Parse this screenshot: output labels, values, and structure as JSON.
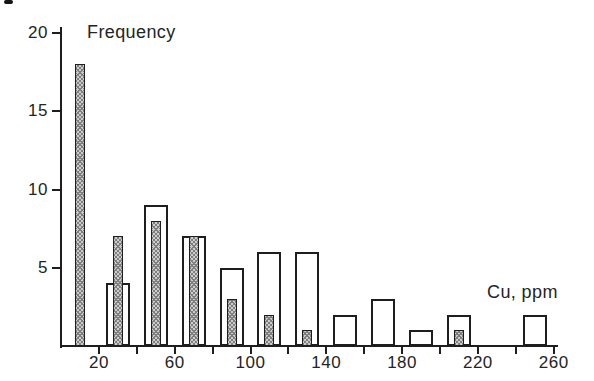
{
  "figure": {
    "kind": "scanned histogram figure",
    "background": "#ffffff"
  },
  "colors": {
    "ink": "#1e1e1e",
    "text": "#242424",
    "hatch_fill": "#cccccc",
    "hatch_line": "#7f7f7f",
    "open_bar_fill": "#ffffff"
  },
  "chart_data": {
    "type": "bar",
    "subtype": "overlaid histograms",
    "title": "",
    "ylabel": "Frequency",
    "xlabel": "Cu, ppm",
    "ylim": [
      0,
      20
    ],
    "y_ticks": [
      5,
      10,
      15,
      20
    ],
    "x_range_ppm": [
      0,
      262
    ],
    "x_minor_ticks": [
      20,
      40,
      60,
      80,
      100,
      120,
      140,
      160,
      180,
      200,
      220,
      240,
      260
    ],
    "x_labeled_ticks": [
      20,
      60,
      100,
      140,
      180,
      220,
      260
    ],
    "class_width_ppm": 20,
    "categories": [
      10,
      30,
      50,
      70,
      90,
      110,
      130,
      150,
      170,
      190,
      210,
      230,
      250
    ],
    "series": [
      {
        "name": "open bars",
        "style": "open",
        "values": [
          0,
          4,
          9,
          7,
          5,
          6,
          6,
          2,
          3,
          1,
          2,
          0,
          2
        ]
      },
      {
        "name": "shaded bars",
        "style": "hatched",
        "values": [
          18,
          7,
          8,
          7,
          3,
          2,
          1,
          0,
          0,
          0,
          1,
          0,
          0
        ]
      }
    ],
    "grid": false,
    "legend_position": "none"
  }
}
